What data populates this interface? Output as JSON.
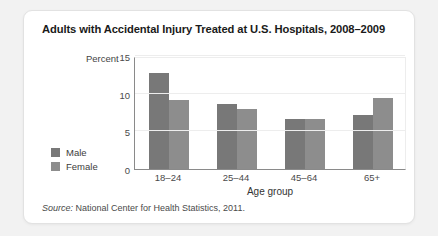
{
  "card": {
    "title": "Adults with Accidental Injury Treated at U.S. Hospitals, 2008–2009",
    "source_prefix": "Source:",
    "source_text": " National Center for Health Statistics, 2011."
  },
  "legend": {
    "items": [
      {
        "label": "Male",
        "color": "#787878"
      },
      {
        "label": "Female",
        "color": "#8d8d8d"
      }
    ]
  },
  "chart_data": {
    "type": "bar",
    "title": "Adults with Accidental Injury Treated at U.S. Hospitals, 2008–2009",
    "xlabel": "Age group",
    "ylabel": "Percent",
    "categories": [
      "18–24",
      "25–44",
      "45–64",
      "65+"
    ],
    "series": [
      {
        "name": "Male",
        "color": "#787878",
        "values": [
          12.8,
          8.6,
          6.6,
          7.2
        ]
      },
      {
        "name": "Female",
        "color": "#8d8d8d",
        "values": [
          9.1,
          8.0,
          6.6,
          9.4
        ]
      }
    ],
    "ylim": [
      0,
      15
    ],
    "yticks": [
      0,
      5,
      10,
      15
    ],
    "ytick_labels": [
      "0",
      "5",
      "10",
      "15"
    ],
    "grid": true,
    "legend_position": "left-outside"
  }
}
